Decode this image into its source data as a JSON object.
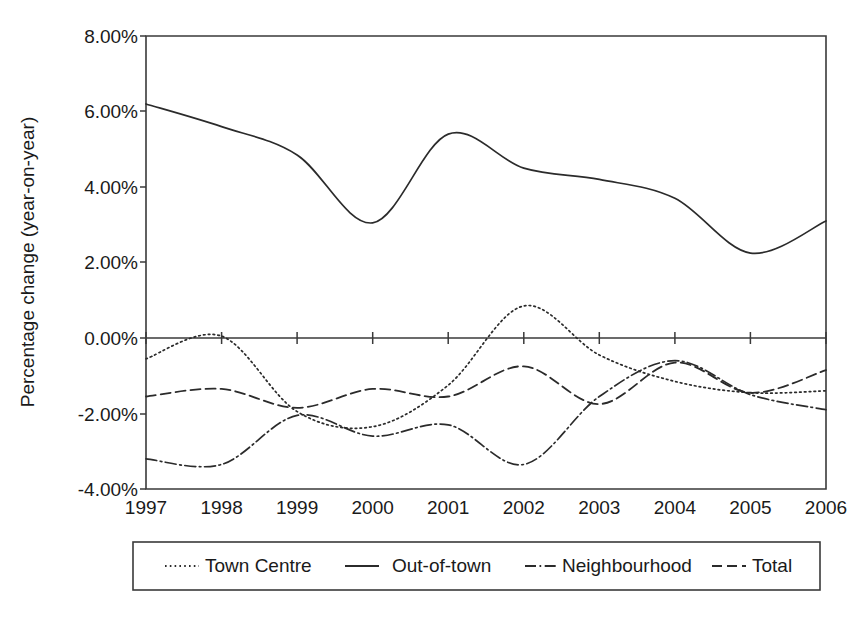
{
  "chart_data": {
    "type": "line",
    "title": "",
    "xlabel": "",
    "ylabel": "Percentage change (year-on-year)",
    "x": [
      1997,
      1998,
      1999,
      2000,
      2001,
      2002,
      2003,
      2004,
      2005,
      2006
    ],
    "categories": [
      "1997",
      "1998",
      "1999",
      "2000",
      "2001",
      "2002",
      "2003",
      "2004",
      "2005",
      "2006"
    ],
    "xlim": [
      1997,
      2006
    ],
    "ylim": [
      -4.0,
      8.0
    ],
    "ytick_values": [
      8.0,
      6.0,
      4.0,
      2.0,
      0.0,
      -2.0,
      -4.0
    ],
    "ytick_labels": [
      "8.00%",
      "6.00%",
      "4.00%",
      "2.00%",
      "0.00%",
      "-2.00%",
      "-4.00%"
    ],
    "grid": false,
    "legend_position": "bottom",
    "units": "percent",
    "series": [
      {
        "name": "Town Centre",
        "style": "dotted",
        "values": [
          -0.55,
          0.05,
          -1.95,
          -2.35,
          -1.25,
          0.85,
          -0.45,
          -1.15,
          -1.45,
          -1.4
        ]
      },
      {
        "name": "Out-of-town",
        "style": "solid",
        "values": [
          6.2,
          5.6,
          4.85,
          3.05,
          5.4,
          4.5,
          4.2,
          3.7,
          2.25,
          3.1
        ]
      },
      {
        "name": "Neighbourhood",
        "style": "dash-dot",
        "values": [
          -3.2,
          -3.35,
          -2.05,
          -2.6,
          -2.3,
          -3.35,
          -1.55,
          -0.6,
          -1.5,
          -1.9
        ]
      },
      {
        "name": "Total",
        "style": "dashed",
        "values": [
          -1.55,
          -1.35,
          -1.85,
          -1.35,
          -1.55,
          -0.75,
          -1.75,
          -0.65,
          -1.45,
          -0.85
        ]
      }
    ]
  },
  "legend": {
    "items": [
      {
        "label": "Town Centre",
        "style": "dotted"
      },
      {
        "label": "Out-of-town",
        "style": "solid"
      },
      {
        "label": "Neighbourhood",
        "style": "dash-dot"
      },
      {
        "label": "Total",
        "style": "dashed"
      }
    ]
  },
  "caption": {
    "text": ""
  },
  "colors": {
    "ink": "#2b2b2b",
    "axis": "#3a3a3a",
    "background": "#ffffff"
  }
}
